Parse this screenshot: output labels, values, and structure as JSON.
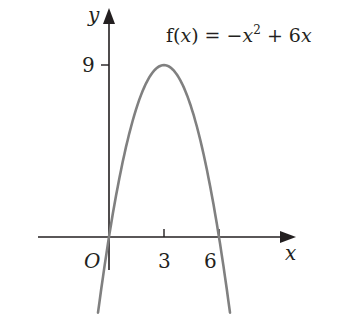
{
  "chart_data": {
    "type": "line",
    "function": "-x^2 + 6x",
    "xlabel": "x",
    "ylabel": "y",
    "origin_label": "O",
    "x_ticks": [
      3,
      6
    ],
    "y_ticks": [
      9
    ],
    "x_tick_labels": [
      "3",
      "6"
    ],
    "y_tick_labels": [
      "9"
    ],
    "xlim": [
      -0.6,
      10
    ],
    "ylim": [
      -2.8,
      11.5
    ],
    "grid": false,
    "series": [
      {
        "name": "f(x)",
        "x": [
          -0.6,
          0,
          1,
          2,
          3,
          4,
          5,
          6,
          6.6
        ],
        "y": [
          -3.96,
          0,
          5,
          8,
          9,
          8,
          5,
          0,
          -3.96
        ]
      }
    ],
    "key_points": [
      {
        "label": "root",
        "x": 0,
        "y": 0
      },
      {
        "label": "vertex",
        "x": 3,
        "y": 9
      },
      {
        "label": "root",
        "x": 6,
        "y": 0
      }
    ],
    "colors": {
      "curve": "#808080",
      "axes": "#231f20",
      "text": "#231f20"
    }
  },
  "labels": {
    "title_f": "f(",
    "title_x": "x",
    "title_rest": ") = −",
    "title_x2": "x",
    "title_sup": "2",
    "title_tail": " + 6",
    "title_x3": "x",
    "y_axis": "y",
    "x_axis": "x",
    "origin": "O",
    "tick_3": "3",
    "tick_6": "6",
    "tick_9": "9"
  }
}
